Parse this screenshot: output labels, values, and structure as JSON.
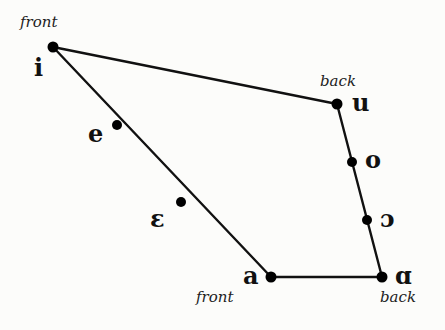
{
  "diagram": {
    "type": "vowel-quadrilateral",
    "vertices": {
      "i": {
        "x": 53,
        "y": 47,
        "symbol": "i",
        "caption": "front"
      },
      "u": {
        "x": 337,
        "y": 104,
        "symbol": "u",
        "caption": "back"
      },
      "a": {
        "x": 271,
        "y": 277,
        "symbol": "a",
        "caption": "front"
      },
      "ɑ": {
        "x": 382,
        "y": 277,
        "symbol": "ɑ",
        "caption": "back"
      }
    },
    "points": [
      {
        "id": "i",
        "x": 53,
        "y": 47,
        "symbol": "i"
      },
      {
        "id": "e",
        "x": 117,
        "y": 125,
        "symbol": "e"
      },
      {
        "id": "epsilon",
        "x": 181,
        "y": 202,
        "symbol": "ɛ"
      },
      {
        "id": "a",
        "x": 271,
        "y": 277,
        "symbol": "a"
      },
      {
        "id": "alpha",
        "x": 382,
        "y": 277,
        "symbol": "ɑ"
      },
      {
        "id": "open-o",
        "x": 367,
        "y": 220,
        "symbol": "ɔ"
      },
      {
        "id": "o",
        "x": 352,
        "y": 162,
        "symbol": "o"
      },
      {
        "id": "u",
        "x": 337,
        "y": 104,
        "symbol": "u"
      }
    ],
    "edges": [
      [
        "i",
        "u"
      ],
      [
        "u",
        "ɑ"
      ],
      [
        "ɑ",
        "a"
      ],
      [
        "a",
        "i"
      ]
    ],
    "labels": {
      "i_symbol": "i",
      "i_caption": "front",
      "u_symbol": "u",
      "u_caption": "back",
      "e_symbol": "e",
      "epsilon_symbol": "ɛ",
      "o_symbol": "o",
      "open_o_symbol": "ɔ",
      "a_symbol": "a",
      "a_caption": "front",
      "alpha_symbol": "ɑ",
      "alpha_caption": "back"
    },
    "colors": {
      "line": "#111111",
      "dot": "#000000",
      "background": "#fcfcfa"
    }
  }
}
